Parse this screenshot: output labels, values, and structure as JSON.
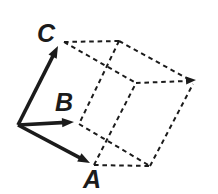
{
  "figure": {
    "type": "vector-parallelepiped-diagram",
    "colors": {
      "ink": "#1b1b1b",
      "background": "#ffffff"
    },
    "canvas": {
      "width": 218,
      "height": 194
    },
    "vector_labels": {
      "a": "A",
      "b": "B",
      "c": "C"
    },
    "vectors": [
      {
        "key": "a",
        "from": [
          18,
          125
        ],
        "to": [
          90,
          163
        ]
      },
      {
        "key": "b",
        "from": [
          18,
          125
        ],
        "to": [
          74,
          122
        ]
      },
      {
        "key": "c",
        "from": [
          18,
          125
        ],
        "to": [
          58,
          46
        ]
      }
    ],
    "dashed_edges": [
      {
        "id": "top-edge",
        "from": [
          64,
          42
        ],
        "to": [
          119,
          41
        ]
      },
      {
        "id": "upper-left-to-mid",
        "from": [
          64,
          42
        ],
        "to": [
          136,
          83
        ]
      },
      {
        "id": "top-mid-to-b-vertex",
        "from": [
          119,
          41
        ],
        "to": [
          79,
          124
        ]
      },
      {
        "id": "top-mid-to-far",
        "from": [
          119,
          41
        ],
        "to": [
          190,
          80
        ]
      },
      {
        "id": "mid-to-far",
        "from": [
          136,
          83
        ],
        "to": [
          187,
          81
        ]
      },
      {
        "id": "b-vertex-to-bottom",
        "from": [
          79,
          124
        ],
        "to": [
          150,
          166
        ]
      },
      {
        "id": "bottom-edge",
        "from": [
          94,
          165
        ],
        "to": [
          150,
          166
        ]
      },
      {
        "id": "a-vertex-to-mid",
        "from": [
          94,
          165
        ],
        "to": [
          136,
          83
        ]
      },
      {
        "id": "bottom-to-far",
        "from": [
          150,
          166
        ],
        "to": [
          193,
          84
        ]
      }
    ],
    "dashed_arrowhead": {
      "tip": [
        196,
        80
      ],
      "angle_deg": -3
    }
  }
}
